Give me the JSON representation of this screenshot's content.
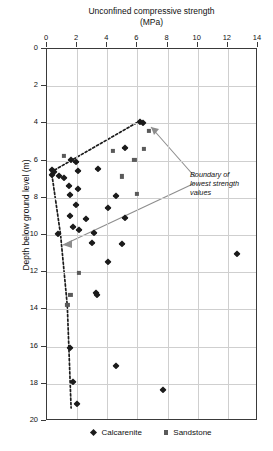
{
  "chart_data": {
    "type": "scatter",
    "title": "Unconfined compressive strength (MPa)",
    "title_line1": "Unconfined compressive strength",
    "title_line2": "(MPa)",
    "xlabel": "Unconfined compressive strength (MPa)",
    "ylabel": "Depth below ground level (m)",
    "xlim": [
      0,
      14
    ],
    "ylim": [
      20,
      0
    ],
    "y_inverted": true,
    "xticks": [
      0,
      2,
      4,
      6,
      8,
      10,
      12,
      14
    ],
    "yticks": [
      0,
      2,
      4,
      6,
      8,
      10,
      12,
      14,
      16,
      18,
      20
    ],
    "grid": true,
    "legend_position": "below",
    "series": [
      {
        "name": "Calcarenite",
        "marker": "diamond",
        "color": "#1b1b1b",
        "points": [
          [
            6.2,
            3.95
          ],
          [
            6.35,
            4.0
          ],
          [
            5.15,
            5.3
          ],
          [
            1.6,
            5.95
          ],
          [
            1.9,
            6.05
          ],
          [
            3.4,
            6.45
          ],
          [
            2.05,
            6.55
          ],
          [
            0.35,
            6.5
          ],
          [
            0.45,
            6.6
          ],
          [
            0.3,
            6.75
          ],
          [
            0.8,
            6.85
          ],
          [
            1.1,
            6.95
          ],
          [
            1.45,
            7.35
          ],
          [
            2.05,
            7.5
          ],
          [
            1.55,
            7.85
          ],
          [
            4.6,
            7.9
          ],
          [
            1.9,
            8.4
          ],
          [
            4.05,
            8.55
          ],
          [
            1.55,
            9.0
          ],
          [
            2.6,
            9.15
          ],
          [
            5.15,
            9.1
          ],
          [
            1.75,
            9.55
          ],
          [
            2.1,
            9.75
          ],
          [
            3.15,
            9.9
          ],
          [
            0.7,
            9.95
          ],
          [
            5.0,
            10.5
          ],
          [
            3.0,
            10.45
          ],
          [
            4.05,
            11.45
          ],
          [
            3.25,
            13.1
          ],
          [
            3.35,
            13.25
          ],
          [
            1.55,
            16.05
          ],
          [
            4.55,
            17.05
          ],
          [
            1.7,
            17.9
          ],
          [
            7.7,
            18.35
          ],
          [
            2.0,
            19.1
          ],
          [
            12.6,
            11.0
          ]
        ]
      },
      {
        "name": "Sandstone",
        "marker": "square",
        "color": "#5a5a5a",
        "points": [
          [
            6.75,
            4.4
          ],
          [
            6.45,
            5.35
          ],
          [
            4.35,
            5.5
          ],
          [
            5.8,
            5.95
          ],
          [
            1.1,
            5.75
          ],
          [
            4.95,
            6.85
          ],
          [
            5.95,
            7.8
          ],
          [
            2.1,
            12.05
          ],
          [
            1.55,
            13.2
          ],
          [
            1.35,
            13.75
          ]
        ]
      }
    ],
    "annotations": [
      {
        "text": "Boundary of lowest strength values",
        "line1": "Boundary of",
        "line2": "lowest strength",
        "line3": "values",
        "style": "italic"
      }
    ],
    "boundary_line": {
      "style": "dotted",
      "color": "#1b1b1b",
      "vertices": [
        [
          6.2,
          3.85
        ],
        [
          0.3,
          6.6
        ],
        [
          0.9,
          10.0
        ],
        [
          1.35,
          13.8
        ],
        [
          1.6,
          19.3
        ]
      ]
    }
  },
  "legend": {
    "items": [
      {
        "label": "Calcarenite",
        "marker": "diamond"
      },
      {
        "label": "Sandstone",
        "marker": "square"
      }
    ]
  }
}
